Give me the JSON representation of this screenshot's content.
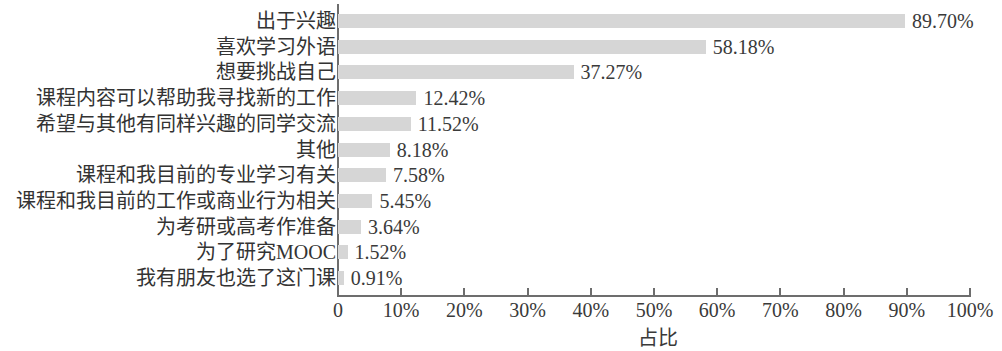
{
  "chart_data": {
    "type": "bar",
    "orientation": "horizontal",
    "title": "",
    "xlabel": "占比",
    "ylabel": "",
    "xlim": [
      0,
      100
    ],
    "grid": false,
    "legend": null,
    "bar_color": "#d6d6d6",
    "axis_color": "#6d6d6d",
    "text_color": "#3a3a3a",
    "categories": [
      "出于兴趣",
      "喜欢学习外语",
      "想要挑战自己",
      "课程内容可以帮助我寻找新的工作",
      "希望与其他有同样兴趣的同学交流",
      "其他",
      "课程和我目前的专业学习有关",
      "课程和我目前的工作或商业行为相关",
      "为考研或高考作准备",
      "为了研究MOOC",
      "我有朋友也选了这门课"
    ],
    "values": [
      89.7,
      58.18,
      37.27,
      12.42,
      11.52,
      8.18,
      7.58,
      5.45,
      3.64,
      1.52,
      0.91
    ],
    "value_labels": [
      "89.70%",
      "58.18%",
      "37.27%",
      "12.42%",
      "11.52%",
      "8.18%",
      "7.58%",
      "5.45%",
      "3.64%",
      "1.52%",
      "0.91%"
    ],
    "xticks": [
      0,
      10,
      20,
      30,
      40,
      50,
      60,
      70,
      80,
      90,
      100
    ],
    "xtick_labels": [
      "0",
      "10%",
      "20%",
      "30%",
      "40%",
      "50%",
      "60%",
      "70%",
      "80%",
      "90%",
      "100%"
    ]
  }
}
